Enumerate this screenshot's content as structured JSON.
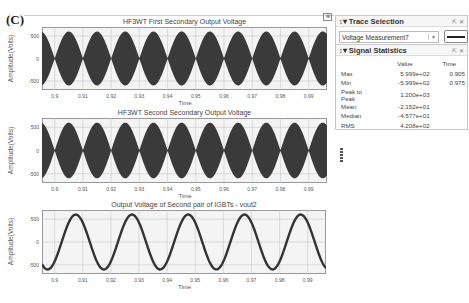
{
  "figure_label": "(C)",
  "plots": [
    {
      "title": "HF3WT First Secondary Output Voltage",
      "xlabel": "Time",
      "ylabel": "Amplitude(Volts)",
      "yticks": [
        "500",
        "0",
        "-500"
      ],
      "xticks": [
        "0.9",
        "0.91",
        "0.92",
        "0.93",
        "0.94",
        "0.95",
        "0.96",
        "0.97",
        "0.98",
        "0.99"
      ]
    },
    {
      "title": "HF3WT Second Secondary Output Voltage",
      "xlabel": "Time",
      "ylabel": "Amplitude(Volts)",
      "yticks": [
        "500",
        "0",
        "-500"
      ],
      "xticks": [
        "0.9",
        "0.91",
        "0.92",
        "0.93",
        "0.94",
        "0.95",
        "0.96",
        "0.97",
        "0.98",
        "0.99"
      ]
    },
    {
      "title": "Output Voltage of Second pair of IGBTs - vout2",
      "xlabel": "Time",
      "ylabel": "Amplitude(Volts)",
      "yticks": [
        "500",
        "0",
        "-500"
      ],
      "xticks": [
        "0.9",
        "0.91",
        "0.92",
        "0.93",
        "0.94",
        "0.95",
        "0.96",
        "0.97",
        "0.98",
        "0.99"
      ]
    }
  ],
  "trace_selection": {
    "title": "Trace Selection",
    "controls": "⇱ ✕",
    "selected": "Voltage Measurement7"
  },
  "signal_statistics": {
    "title": "Signal Statistics",
    "controls": "⇱ ✕",
    "columns": [
      "",
      "Value",
      "Time"
    ],
    "rows": [
      {
        "name": "Max",
        "value": "5.999e+02",
        "time": "0.905"
      },
      {
        "name": "Min",
        "value": "-5.999e+02",
        "time": "0.975"
      },
      {
        "name": "Peak to Peak",
        "value": "1.200e+03",
        "time": ""
      },
      {
        "name": "Mean",
        "value": "-2.152e+01",
        "time": ""
      },
      {
        "name": "Median",
        "value": "-4.577e+01",
        "time": ""
      },
      {
        "name": "RMS",
        "value": "4.208e+02",
        "time": ""
      }
    ]
  },
  "chart_data": [
    {
      "type": "line",
      "title": "HF3WT First Secondary Output Voltage",
      "xlabel": "Time",
      "ylabel": "Amplitude(Volts)",
      "xlim": [
        0.8955,
        0.9965
      ],
      "ylim": [
        -700,
        700
      ],
      "grid": true,
      "description": "High-frequency carrier with amplitude envelope |600*sin(2*pi*50*t)|; lobes every 0.01 s, envelope peak 600 V",
      "envelope_peak": 600,
      "envelope_period": 0.01,
      "xticks": [
        0.9,
        0.91,
        0.92,
        0.93,
        0.94,
        0.95,
        0.96,
        0.97,
        0.98,
        0.99
      ],
      "yticks": [
        -500,
        0,
        500
      ]
    },
    {
      "type": "line",
      "title": "HF3WT Second Secondary Output Voltage",
      "xlabel": "Time",
      "ylabel": "Amplitude(Volts)",
      "xlim": [
        0.8955,
        0.9965
      ],
      "ylim": [
        -700,
        700
      ],
      "grid": true,
      "description": "High-frequency carrier with amplitude envelope |600*sin(2*pi*50*t)|; lobes every 0.01 s, envelope peak 600 V",
      "envelope_peak": 600,
      "envelope_period": 0.01,
      "xticks": [
        0.9,
        0.91,
        0.92,
        0.93,
        0.94,
        0.95,
        0.96,
        0.97,
        0.98,
        0.99
      ],
      "yticks": [
        -500,
        0,
        500
      ]
    },
    {
      "type": "line",
      "title": "Output Voltage of Second pair of IGBTs - vout2",
      "xlabel": "Time",
      "ylabel": "Amplitude(Volts)",
      "xlim": [
        0.8955,
        0.9965
      ],
      "ylim": [
        -700,
        700
      ],
      "grid": true,
      "description": "50 Hz sine wave, amplitude ~600 V",
      "amplitude": 600,
      "frequency_hz": 50,
      "x": [
        0.8975,
        0.9025,
        0.9075,
        0.9125,
        0.9175,
        0.9225,
        0.9275,
        0.9325,
        0.9375,
        0.9425,
        0.9475,
        0.9525,
        0.9575,
        0.9625,
        0.9675,
        0.9725,
        0.9775,
        0.9825,
        0.9875,
        0.9925
      ],
      "y": [
        -600,
        0,
        600,
        0,
        -600,
        0,
        600,
        0,
        -600,
        0,
        600,
        0,
        -600,
        0,
        600,
        0,
        -600,
        0,
        600,
        0
      ],
      "xticks": [
        0.9,
        0.91,
        0.92,
        0.93,
        0.94,
        0.95,
        0.96,
        0.97,
        0.98,
        0.99
      ],
      "yticks": [
        -500,
        0,
        500
      ]
    }
  ]
}
